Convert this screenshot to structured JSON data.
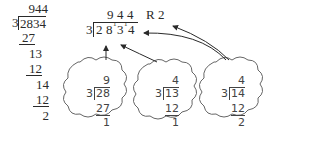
{
  "left_division": {
    "quotient": "944",
    "divisor": "3",
    "dividend": "2834",
    "steps": [
      "27",
      "13",
      "12",
      "14",
      "12",
      "2"
    ]
  },
  "main_division": {
    "quotient": [
      "9",
      "4",
      "4"
    ],
    "remainder_label": "R 2",
    "divisor": "3",
    "dividend_digits": [
      "2",
      "8",
      "3",
      "4"
    ],
    "carry_marks": [
      "1",
      "1"
    ]
  },
  "clouds": [
    {
      "quotient": "9",
      "divisor": "3",
      "dividend": "28",
      "product": "27",
      "remainder": "1"
    },
    {
      "quotient": "4",
      "divisor": "3",
      "dividend": "13",
      "product": "12",
      "remainder": "1"
    },
    {
      "quotient": "4",
      "divisor": "3",
      "dividend": "14",
      "product": "12",
      "remainder": "2"
    }
  ],
  "colors": {
    "ink": "#2a2a2a",
    "cloud_stroke": "#666666"
  }
}
